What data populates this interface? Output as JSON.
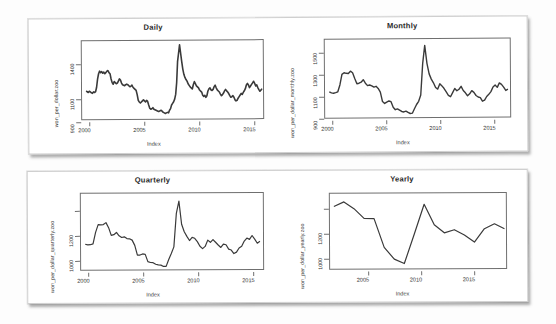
{
  "figure": {
    "background_color": "#fdfdfd",
    "sheet_color": "#ffffff",
    "line_color": "#3a3a3a",
    "axis_color": "#6f6f6f",
    "sheets": [
      "top-sheet",
      "bottom-sheet"
    ]
  },
  "charts": [
    {
      "id": "daily",
      "title": "Daily",
      "ylabel": "won_per_dollar.zoo",
      "xlabel": "Index",
      "xticks": [
        "2000",
        "2005",
        "2010",
        "2015"
      ],
      "yticks": [
        "900",
        "1100",
        "1400"
      ]
    },
    {
      "id": "monthly",
      "title": "Monthly",
      "ylabel": "won_per_dollar_monthly.zoo",
      "xlabel": "Index",
      "xticks": [
        "2000",
        "2005",
        "2010",
        "2015"
      ],
      "yticks": [
        "900",
        "1100",
        "1300",
        "1500"
      ]
    },
    {
      "id": "quarterly",
      "title": "Quarterly",
      "ylabel": "won_per_dollar_quarterly.zoo",
      "xlabel": "Index",
      "xticks": [
        "2000",
        "2005",
        "2010",
        "2015"
      ],
      "yticks": [
        "1000",
        "1200"
      ]
    },
    {
      "id": "yearly",
      "title": "Yearly",
      "ylabel": "won_per_dollar_yearly.zoo",
      "xlabel": "Index",
      "xticks": [
        "2005",
        "2010",
        "2015"
      ],
      "yticks": [
        "1000",
        "1200"
      ]
    }
  ],
  "chart_data": [
    {
      "type": "line",
      "id": "daily",
      "title": "Daily",
      "xlabel": "Index",
      "ylabel": "won_per_dollar.zoo",
      "xlim": [
        1999.6,
        2017.0
      ],
      "ylim": [
        860,
        1600
      ],
      "xticks": [
        2000,
        2005,
        2010,
        2015
      ],
      "yticks": [
        900,
        1100,
        1400
      ],
      "grid": false,
      "legend": "none",
      "note": "KRW per USD daily exchange rate, noisy high-frequency series",
      "x": [
        2000.0,
        2000.1,
        2000.2,
        2000.3,
        2000.4,
        2000.5,
        2000.6,
        2000.7,
        2000.8,
        2000.9,
        2001.0,
        2001.1,
        2001.2,
        2001.3,
        2001.4,
        2001.5,
        2001.6,
        2001.7,
        2001.8,
        2001.9,
        2002.0,
        2002.1,
        2002.2,
        2002.3,
        2002.4,
        2002.5,
        2002.6,
        2002.7,
        2002.8,
        2002.9,
        2003.0,
        2003.1,
        2003.2,
        2003.3,
        2003.4,
        2003.5,
        2003.6,
        2003.7,
        2003.8,
        2003.9,
        2004.0,
        2004.1,
        2004.2,
        2004.3,
        2004.4,
        2004.5,
        2004.6,
        2004.7,
        2004.8,
        2004.9,
        2005.0,
        2005.1,
        2005.2,
        2005.3,
        2005.4,
        2005.5,
        2005.6,
        2005.7,
        2005.8,
        2005.9,
        2006.0,
        2006.1,
        2006.2,
        2006.3,
        2006.4,
        2006.5,
        2006.6,
        2006.7,
        2006.8,
        2006.9,
        2007.0,
        2007.1,
        2007.2,
        2007.3,
        2007.4,
        2007.5,
        2007.6,
        2007.7,
        2007.8,
        2007.9,
        2008.0,
        2008.1,
        2008.2,
        2008.3,
        2008.4,
        2008.5,
        2008.6,
        2008.7,
        2008.8,
        2008.9,
        2009.0,
        2009.1,
        2009.2,
        2009.3,
        2009.4,
        2009.5,
        2009.6,
        2009.7,
        2009.8,
        2009.9,
        2010.0,
        2010.1,
        2010.2,
        2010.3,
        2010.4,
        2010.5,
        2010.6,
        2010.7,
        2010.8,
        2010.9,
        2011.0,
        2011.1,
        2011.2,
        2011.3,
        2011.4,
        2011.5,
        2011.6,
        2011.7,
        2011.8,
        2011.9,
        2012.0,
        2012.1,
        2012.2,
        2012.3,
        2012.4,
        2012.5,
        2012.6,
        2012.7,
        2012.8,
        2012.9,
        2013.0,
        2013.1,
        2013.2,
        2013.3,
        2013.4,
        2013.5,
        2013.6,
        2013.7,
        2013.8,
        2013.9,
        2014.0,
        2014.1,
        2014.2,
        2014.3,
        2014.4,
        2014.5,
        2014.6,
        2014.7,
        2014.8,
        2014.9,
        2015.0,
        2015.1,
        2015.2,
        2015.3,
        2015.4,
        2015.5,
        2015.6,
        2015.7,
        2015.8,
        2015.9,
        2016.0,
        2016.1,
        2016.2,
        2016.3,
        2016.4,
        2016.5,
        2016.6,
        2016.7,
        2016.8,
        2016.9
      ],
      "y": [
        1128,
        1120,
        1113,
        1125,
        1118,
        1110,
        1105,
        1118,
        1112,
        1120,
        1160,
        1240,
        1290,
        1315,
        1300,
        1310,
        1295,
        1305,
        1290,
        1300,
        1315,
        1320,
        1300,
        1290,
        1240,
        1205,
        1190,
        1215,
        1205,
        1195,
        1200,
        1220,
        1240,
        1230,
        1200,
        1185,
        1180,
        1175,
        1185,
        1190,
        1185,
        1175,
        1165,
        1170,
        1180,
        1160,
        1150,
        1140,
        1130,
        1090,
        1035,
        1020,
        1010,
        1020,
        1030,
        1040,
        1030,
        1020,
        1035,
        1025,
        990,
        960,
        950,
        955,
        965,
        950,
        945,
        940,
        935,
        930,
        930,
        935,
        940,
        930,
        920,
        915,
        910,
        915,
        920,
        915,
        940,
        955,
        990,
        1005,
        1020,
        1045,
        1090,
        1200,
        1400,
        1480,
        1560,
        1480,
        1400,
        1330,
        1280,
        1250,
        1230,
        1215,
        1190,
        1175,
        1160,
        1150,
        1140,
        1180,
        1210,
        1190,
        1170,
        1160,
        1150,
        1130,
        1120,
        1110,
        1080,
        1070,
        1080,
        1060,
        1075,
        1120,
        1140,
        1150,
        1130,
        1125,
        1135,
        1160,
        1175,
        1150,
        1130,
        1120,
        1110,
        1090,
        1075,
        1085,
        1100,
        1120,
        1135,
        1120,
        1110,
        1095,
        1075,
        1060,
        1065,
        1075,
        1060,
        1035,
        1025,
        1030,
        1050,
        1065,
        1080,
        1095,
        1085,
        1105,
        1120,
        1140,
        1175,
        1190,
        1175,
        1150,
        1165,
        1180,
        1195,
        1210,
        1190,
        1165,
        1175,
        1150,
        1130,
        1115,
        1125,
        1140
      ]
    },
    {
      "type": "line",
      "id": "monthly",
      "title": "Monthly",
      "xlabel": "Index",
      "ylabel": "won_per_dollar_monthly.zoo",
      "xlim": [
        1999.6,
        2017.0
      ],
      "ylim": [
        880,
        1620
      ],
      "xticks": [
        2000,
        2005,
        2010,
        2015
      ],
      "yticks": [
        900,
        1100,
        1300,
        1500
      ],
      "grid": false,
      "legend": "none",
      "x": [
        2000.0,
        2000.2,
        2000.4,
        2000.6,
        2000.8,
        2001.0,
        2001.2,
        2001.4,
        2001.6,
        2001.8,
        2002.0,
        2002.2,
        2002.4,
        2002.6,
        2002.8,
        2003.0,
        2003.2,
        2003.4,
        2003.6,
        2003.8,
        2004.0,
        2004.2,
        2004.4,
        2004.6,
        2004.8,
        2005.0,
        2005.2,
        2005.4,
        2005.6,
        2005.8,
        2006.0,
        2006.2,
        2006.4,
        2006.6,
        2006.8,
        2007.0,
        2007.2,
        2007.4,
        2007.6,
        2007.8,
        2008.0,
        2008.2,
        2008.4,
        2008.6,
        2008.8,
        2009.0,
        2009.2,
        2009.4,
        2009.6,
        2009.8,
        2010.0,
        2010.2,
        2010.4,
        2010.6,
        2010.8,
        2011.0,
        2011.2,
        2011.4,
        2011.6,
        2011.8,
        2012.0,
        2012.2,
        2012.4,
        2012.6,
        2012.8,
        2013.0,
        2013.2,
        2013.4,
        2013.6,
        2013.8,
        2014.0,
        2014.2,
        2014.4,
        2014.6,
        2014.8,
        2015.0,
        2015.2,
        2015.4,
        2015.6,
        2015.8,
        2016.0,
        2016.2,
        2016.4,
        2016.6,
        2016.8
      ],
      "y": [
        1125,
        1115,
        1112,
        1118,
        1125,
        1190,
        1290,
        1305,
        1300,
        1298,
        1320,
        1305,
        1250,
        1200,
        1205,
        1215,
        1238,
        1205,
        1182,
        1188,
        1180,
        1168,
        1175,
        1155,
        1120,
        1030,
        1012,
        1025,
        1035,
        1028,
        975,
        952,
        960,
        948,
        935,
        930,
        938,
        925,
        915,
        918,
        960,
        1000,
        1030,
        1090,
        1390,
        1560,
        1390,
        1290,
        1240,
        1205,
        1160,
        1145,
        1195,
        1175,
        1150,
        1118,
        1085,
        1072,
        1110,
        1150,
        1128,
        1142,
        1170,
        1130,
        1108,
        1080,
        1098,
        1128,
        1112,
        1082,
        1068,
        1062,
        1028,
        1038,
        1072,
        1092,
        1118,
        1162,
        1180,
        1158,
        1200,
        1186,
        1160,
        1128,
        1140
      ]
    },
    {
      "type": "line",
      "id": "quarterly",
      "title": "Quarterly",
      "xlabel": "Index",
      "ylabel": "won_per_dollar_quarterly.zoo",
      "xlim": [
        1999.6,
        2017.0
      ],
      "ylim": [
        890,
        1580
      ],
      "xticks": [
        2000,
        2005,
        2010,
        2015
      ],
      "yticks": [
        1000,
        1200
      ],
      "grid": false,
      "legend": "none",
      "x": [
        2000.0,
        2000.25,
        2000.5,
        2000.75,
        2001.0,
        2001.25,
        2001.5,
        2001.75,
        2002.0,
        2002.25,
        2002.5,
        2002.75,
        2003.0,
        2003.25,
        2003.5,
        2003.75,
        2004.0,
        2004.25,
        2004.5,
        2004.75,
        2005.0,
        2005.25,
        2005.5,
        2005.75,
        2006.0,
        2006.25,
        2006.5,
        2006.75,
        2007.0,
        2007.25,
        2007.5,
        2007.75,
        2008.0,
        2008.25,
        2008.5,
        2008.75,
        2009.0,
        2009.25,
        2009.5,
        2009.75,
        2010.0,
        2010.25,
        2010.5,
        2010.75,
        2011.0,
        2011.25,
        2011.5,
        2011.75,
        2012.0,
        2012.25,
        2012.5,
        2012.75,
        2013.0,
        2013.25,
        2013.5,
        2013.75,
        2014.0,
        2014.25,
        2014.5,
        2014.75,
        2015.0,
        2015.25,
        2015.5,
        2015.75,
        2016.0,
        2016.25,
        2016.5,
        2016.75
      ],
      "y": [
        1122,
        1116,
        1118,
        1126,
        1230,
        1300,
        1298,
        1300,
        1318,
        1272,
        1202,
        1208,
        1228,
        1198,
        1182,
        1188,
        1172,
        1170,
        1158,
        1110,
        1022,
        1022,
        1032,
        1028,
        962,
        954,
        952,
        938,
        932,
        930,
        918,
        918,
        980,
        1035,
        1095,
        1400,
        1510,
        1300,
        1232,
        1190,
        1152,
        1180,
        1172,
        1142,
        1100,
        1078,
        1098,
        1155,
        1135,
        1160,
        1135,
        1110,
        1088,
        1118,
        1112,
        1072,
        1064,
        1032,
        1045,
        1082,
        1098,
        1145,
        1172,
        1160,
        1195,
        1162,
        1125,
        1142
      ]
    },
    {
      "type": "line",
      "id": "yearly",
      "title": "Yearly",
      "xlabel": "Index",
      "ylabel": "won_per_dollar_yearly.zoo",
      "xlim": [
        1999.6,
        2017.2
      ],
      "ylim": [
        900,
        1340
      ],
      "xticks": [
        2005,
        2010,
        2015
      ],
      "yticks": [
        1000,
        1200
      ],
      "grid": false,
      "legend": "none",
      "x": [
        2000,
        2001,
        2002,
        2003,
        2004,
        2005,
        2006,
        2007,
        2008,
        2009,
        2010,
        2011,
        2012,
        2013,
        2014,
        2015,
        2016,
        2017
      ],
      "y": [
        1265,
        1292,
        1252,
        1195,
        1193,
        1024,
        955,
        929,
        1100,
        1276,
        1156,
        1108,
        1126,
        1095,
        1053,
        1131,
        1160,
        1130
      ]
    }
  ]
}
